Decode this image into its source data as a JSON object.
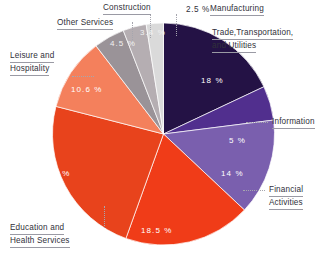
{
  "chart_data": {
    "type": "pie",
    "title": "",
    "subtitle": "",
    "xlabel": "",
    "ylabel": "",
    "legend_position": "none",
    "grid": false,
    "units": "percent",
    "start_angle_deg": 0,
    "direction": "clockwise",
    "categories": [
      "Trade, Transportation, and Utilities",
      "Information",
      "Financial Activities",
      "Education and Health Services",
      "Professional and Business Services",
      "Leisure and Hospitality",
      "Other Services",
      "Construction",
      "Manufacturing"
    ],
    "values": [
      18,
      5,
      14,
      18.5,
      23.5,
      10.6,
      4.5,
      3.4,
      2.5
    ],
    "colors": [
      "#241245",
      "#512f8e",
      "#7a5fae",
      "#f03c18",
      "#e8431c",
      "#f4805c",
      "#9a9398",
      "#b5aeb2",
      "#dadada"
    ],
    "slices": [
      {
        "label": "Trade, Transportation, and Utilities",
        "value": 18,
        "value_text": "18 %",
        "color": "#241245",
        "label_placement": "outside-right",
        "value_placement": "inside"
      },
      {
        "label": "Information",
        "value": 5,
        "value_text": "5 %",
        "color": "#512f8e",
        "label_placement": "outside-right",
        "value_placement": "inside"
      },
      {
        "label": "Financial Activities",
        "value": 14,
        "value_text": "14 %",
        "color": "#7a5fae",
        "label_placement": "outside-right",
        "value_placement": "inside"
      },
      {
        "label": "Education and Health Services",
        "value": 18.5,
        "value_text": "18.5 %",
        "color": "#f03c18",
        "label_placement": "outside-left",
        "value_placement": "inside"
      },
      {
        "label": "",
        "value": 23.5,
        "value_text": "23.5 %",
        "color": "#e8431c",
        "label_placement": "none",
        "value_placement": "inside"
      },
      {
        "label": "Leisure and Hospitality",
        "value": 10.6,
        "value_text": "10.6 %",
        "color": "#f4805c",
        "label_placement": "outside-left",
        "value_placement": "inside"
      },
      {
        "label": "Other Services",
        "value": 4.5,
        "value_text": "4.5 %",
        "color": "#9a9398",
        "label_placement": "outside-top",
        "value_placement": "inside"
      },
      {
        "label": "Construction",
        "value": 3.4,
        "value_text": "3.4 %",
        "color": "#b5aeb2",
        "label_placement": "outside-top",
        "value_placement": "inside"
      },
      {
        "label": "Manufacturing",
        "value": 2.5,
        "value_text": "2.5 %",
        "color": "#dadada",
        "label_placement": "outside-top",
        "value_placement": "outside"
      }
    ]
  },
  "labels": {
    "trade": {
      "line1": "Trade,Transportation,",
      "line2": "and Utilities"
    },
    "information": "Information",
    "financial": {
      "line1": "Financial",
      "line2": "Activities"
    },
    "education": {
      "line1": "Education and",
      "line2": "Health Services"
    },
    "leisure": {
      "line1": "Leisure and",
      "line2": "Hospitality"
    },
    "other_services": "Other Services",
    "construction": "Construction",
    "manufacturing": "Manufacturing"
  },
  "values_text": {
    "trade": "18 %",
    "information": "5 %",
    "financial": "14 %",
    "education": "18.5 %",
    "professional": "23.5 %",
    "leisure": "10.6 %",
    "other_services": "4.5 %",
    "construction": "3.4 %",
    "manufacturing": "2.5 %"
  }
}
